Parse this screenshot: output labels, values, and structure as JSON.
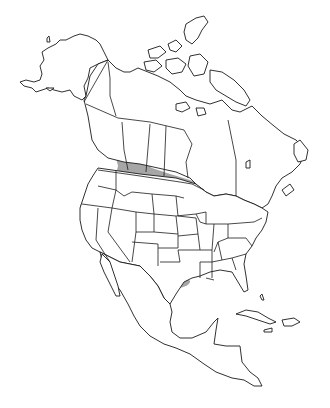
{
  "map": {
    "title": "",
    "region": "North America",
    "colors": {
      "background": "#ffffff",
      "land": "#ffffff",
      "outline": "#1a1a1a",
      "range": "#a6a6a6"
    },
    "range_areas": [
      {
        "name": "main-range",
        "description": "Western and central United States and southern prairie Canada"
      },
      {
        "name": "texas-patch",
        "description": "Small isolated area in central Texas"
      }
    ]
  }
}
